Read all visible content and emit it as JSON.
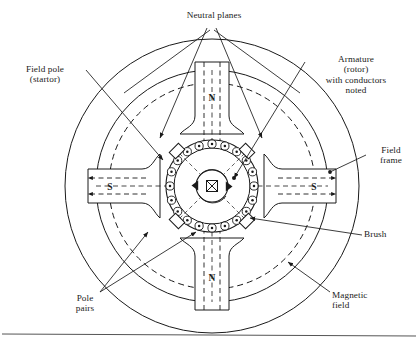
{
  "figure": {
    "title_label": "Neutral planes"
  },
  "labels": {
    "neutral_planes": "Neutral planes",
    "field_pole": "Field pole\n(startor)",
    "armature": "Armature\n(rotor)\nwith conductors\nnoted",
    "field_frame": "Field\nframe",
    "brush": "Brush",
    "magnetic_field": "Magnetic\nfield",
    "pole_pairs": "Pole\npairs"
  },
  "poles": [
    {
      "id": "pole-top",
      "letter": "N",
      "position": "top",
      "flux_direction": "inward"
    },
    {
      "id": "pole-bottom",
      "letter": "N",
      "position": "bottom",
      "flux_direction": "inward"
    },
    {
      "id": "pole-left",
      "letter": "S",
      "position": "left",
      "flux_direction": "outward"
    },
    {
      "id": "pole-right",
      "letter": "S",
      "position": "right",
      "flux_direction": "outward"
    }
  ],
  "geometry": {
    "center_x": 212,
    "center_y": 186,
    "frame_outer_radius": 147,
    "frame_inner_radius": 116,
    "flux_dashed_radius": 103,
    "rotor_radius": 46,
    "shaft_radius": 16,
    "conductor_count": 20,
    "brush_count": 4,
    "pole_half_width": 17
  },
  "symbols": {
    "shaft_center": "crossed-box",
    "conductor_marker": "dot-in-circle",
    "rotation": "clockwise"
  },
  "colors": {
    "ink": "#1a1a1a",
    "paper": "#ffffff",
    "rule": "#555555"
  },
  "footer": {
    "rule_present": true
  }
}
